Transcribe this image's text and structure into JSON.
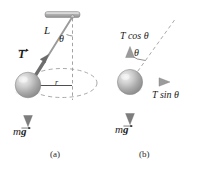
{
  "figure": {
    "background_color": "#ffffff",
    "ink_color": "#1a1a1a",
    "ball_color": "#b9b9b9",
    "ceiling_color": "#a8a8a8",
    "dash_color": "#8c8c8c"
  },
  "panel_a": {
    "caption": "(a)",
    "length_label": "L",
    "angle_label": "θ",
    "tension_label": "T",
    "radius_label": "r",
    "weight_mass_label": "m",
    "weight_gravity_label": "g",
    "elements": {
      "ceiling_name": "ceiling-support-bar",
      "string_name": "pendulum-string",
      "ball_name": "pendulum-bob",
      "path_name": "circular-path-ellipse",
      "vertical_axis_name": "vertical-dashed-axis"
    }
  },
  "panel_b": {
    "caption": "(b)",
    "angle_label": "θ",
    "tension_vertical_label": "T cos θ",
    "tension_horizontal_label": "T sin θ",
    "weight_mass_label": "m",
    "weight_gravity_label": "g",
    "elements": {
      "ball_name": "pendulum-bob",
      "string_name": "pendulum-string-dashed",
      "vertical_component_name": "tension-vertical-component-arrow",
      "horizontal_component_name": "tension-horizontal-component-arrow",
      "weight_name": "weight-arrow"
    }
  }
}
